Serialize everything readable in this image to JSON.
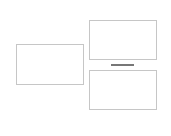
{
  "layout": {
    "panels": [
      {
        "id": "left-panel",
        "x": 16,
        "y": 44,
        "w": 68,
        "h": 41
      },
      {
        "id": "top-right-panel",
        "x": 89,
        "y": 20,
        "w": 68,
        "h": 40
      },
      {
        "id": "bottom-right-panel",
        "x": 89,
        "y": 70,
        "w": 68,
        "h": 40
      }
    ],
    "divider": {
      "x": 111,
      "y": 64,
      "w": 23,
      "h": 2
    }
  },
  "colors": {
    "panel_border": "#c6c6c6",
    "divider": "#777777",
    "background": "#ffffff"
  }
}
